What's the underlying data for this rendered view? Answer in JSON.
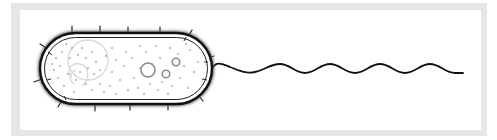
{
  "diagram": {
    "labels": [],
    "colors": {
      "frame": "#e6e6e6",
      "background": "#ffffff",
      "outline": "#111111",
      "nucleoid": "#d6d6d6",
      "granules": "#8c8c8c",
      "ribosomes": "#555555"
    },
    "parts": [
      {
        "name": "cell-wall",
        "shape": "capsule",
        "x": 40,
        "y": 33,
        "width": 172,
        "height": 71
      },
      {
        "name": "cell-membrane",
        "shape": "capsule-inner"
      },
      {
        "name": "nucleoid",
        "shape": "circle-loops",
        "cx": 88,
        "cy": 60
      },
      {
        "name": "storage-granules",
        "count": 3
      },
      {
        "name": "ribosomes",
        "shape": "dots"
      },
      {
        "name": "pili",
        "count": 14
      },
      {
        "name": "flagellum",
        "shape": "sine-wave",
        "x_start": 213,
        "x_end": 463,
        "waves": 5
      }
    ]
  }
}
